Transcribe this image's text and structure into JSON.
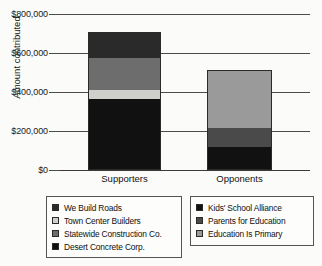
{
  "chart_data": {
    "type": "bar",
    "subtype": "stacked-bar",
    "title": "",
    "xlabel": "",
    "ylabel": "Amount contributed",
    "categories": [
      "Supporters",
      "Opponents"
    ],
    "ylim": [
      0,
      800000
    ],
    "yticks": [
      0,
      200000,
      400000,
      600000,
      800000
    ],
    "ytick_labels": [
      "$0",
      "$200,000",
      "$400,000",
      "$600,000",
      "$800,000"
    ],
    "grid": true,
    "legend_position": "below",
    "series": [
      {
        "name": "Desert Concrete Corp.",
        "group": "Supporters",
        "color": "#111111",
        "values": [
          364000,
          0
        ]
      },
      {
        "name": "Town Center Builders",
        "group": "Supporters",
        "color": "#cfcfcb",
        "values": [
          46000,
          0
        ]
      },
      {
        "name": "Statewide Construction Co.",
        "group": "Supporters",
        "color": "#6d6d6d",
        "values": [
          164000,
          0
        ]
      },
      {
        "name": "We Build Roads",
        "group": "Supporters",
        "color": "#2a2a2a",
        "values": [
          134000,
          0
        ]
      },
      {
        "name": "Kids' School Alliance",
        "group": "Opponents",
        "color": "#111111",
        "values": [
          0,
          118000
        ]
      },
      {
        "name": "Parents for Education",
        "group": "Opponents",
        "color": "#4a4a4a",
        "values": [
          0,
          97000
        ]
      },
      {
        "name": "Education Is Primary",
        "group": "Opponents",
        "color": "#9a9a9a",
        "values": [
          0,
          298000
        ]
      }
    ],
    "totals": [
      708000,
      513000
    ]
  },
  "axes": {
    "y_label": "Amount contributed",
    "y_ticks": [
      {
        "label": "$800,000",
        "value": 800000
      },
      {
        "label": "$600,000",
        "value": 600000
      },
      {
        "label": "$400,000",
        "value": 400000
      },
      {
        "label": "$200,000",
        "value": 200000
      },
      {
        "label": "$0",
        "value": 0
      }
    ],
    "x_ticks": [
      {
        "label": "Supporters"
      },
      {
        "label": "Opponents"
      }
    ]
  },
  "bars": {
    "supporters": {
      "category": "Supporters",
      "total": 708000,
      "segments": [
        {
          "label": "We Build Roads",
          "value": 134000,
          "color": "#2a2a2a"
        },
        {
          "label": "Statewide Construction Co.",
          "value": 164000,
          "color": "#6d6d6d"
        },
        {
          "label": "Town Center Builders",
          "value": 46000,
          "color": "#cfcfcb"
        },
        {
          "label": "Desert Concrete Corp.",
          "value": 364000,
          "color": "#111111"
        }
      ]
    },
    "opponents": {
      "category": "Opponents",
      "total": 513000,
      "segments": [
        {
          "label": "Education Is Primary",
          "value": 298000,
          "color": "#9a9a9a"
        },
        {
          "label": "Parents for Education",
          "value": 97000,
          "color": "#4a4a4a"
        },
        {
          "label": "Kids' School Alliance",
          "value": 118000,
          "color": "#111111"
        }
      ]
    }
  },
  "legend_left": {
    "items": [
      {
        "label": "We Build Roads",
        "color": "#2a2a2a"
      },
      {
        "label": "Town Center Builders",
        "color": "#cfcfcb"
      },
      {
        "label": "Statewide Construction Co.",
        "color": "#6d6d6d"
      },
      {
        "label": "Desert Concrete Corp.",
        "color": "#111111"
      }
    ]
  },
  "legend_right": {
    "items": [
      {
        "label": "Kids' School Alliance",
        "color": "#111111"
      },
      {
        "label": "Parents for Education",
        "color": "#4a4a4a"
      },
      {
        "label": "Education Is Primary",
        "color": "#9a9a9a"
      }
    ]
  }
}
